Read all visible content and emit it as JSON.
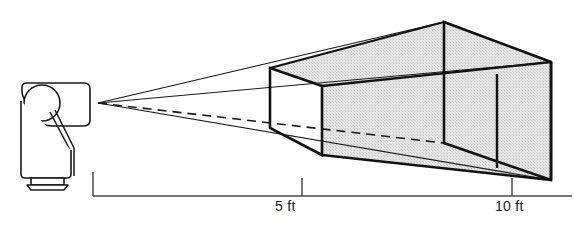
{
  "diagram": {
    "background_color": "#ffffff",
    "stroke_color": "#1a1a1a",
    "fill_color": "#dcdcdc",
    "projector": {
      "name": "projector-body",
      "lens_name": "projector-lens",
      "base_name": "projector-base",
      "apex_x": 98,
      "apex_y": 103
    },
    "planes": [
      {
        "name": "near-screen-plane",
        "distance_label": "5 ft",
        "distance_value": 5,
        "unit": "ft"
      },
      {
        "name": "mid-screen-plane",
        "distance_label": "",
        "distance_value": 7.5,
        "unit": "ft"
      },
      {
        "name": "far-screen-plane",
        "distance_label": "10 ft",
        "distance_value": 10,
        "unit": "ft"
      }
    ],
    "scale": {
      "name": "distance-scale",
      "origin_label": "",
      "ticks": [
        {
          "label": "",
          "x": 93
        },
        {
          "label": "5 ft",
          "x": 302
        },
        {
          "label": "10 ft",
          "x": 512
        }
      ],
      "baseline_y": 196
    }
  },
  "labels": {
    "five_ft": "5 ft",
    "ten_ft": "10 ft"
  }
}
